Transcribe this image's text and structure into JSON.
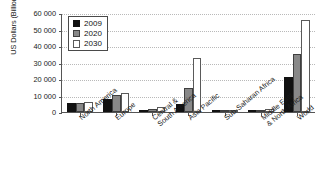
{
  "chart_data": {
    "type": "bar",
    "title": "",
    "subtitle": "",
    "xlabel": "",
    "ylabel": "US Dollars (Billions)",
    "ylim": [
      0,
      60000
    ],
    "yticks": [
      "0",
      "10 000",
      "20 000",
      "30 000",
      "40 000",
      "50 000",
      "60 000"
    ],
    "ytick_values": [
      0,
      10000,
      20000,
      30000,
      40000,
      50000,
      60000
    ],
    "grid": true,
    "grid_axis": "y",
    "legend_position": "top-left",
    "categories": [
      "North America",
      "Europe",
      "Central & South America",
      "Asia Pacific",
      "Sub-Saharan Africa",
      "Middle East & North Africa",
      "World"
    ],
    "category_lines": [
      [
        "North America"
      ],
      [
        "Europe"
      ],
      [
        "Central &",
        "South America"
      ],
      [
        "Asia Pacific"
      ],
      [
        "Sub-Saharan Africa"
      ],
      [
        "Middle East",
        "& North Africa"
      ],
      [
        "World"
      ]
    ],
    "series": [
      {
        "name": "2009",
        "color": "#111111",
        "values": [
          5500,
          7900,
          1400,
          4700,
          400,
          700,
          21000
        ]
      },
      {
        "name": "2020",
        "color": "#888888",
        "values": [
          5500,
          10200,
          2100,
          14700,
          500,
          1200,
          35200
        ]
      },
      {
        "name": "2030",
        "color": "#ffffff",
        "values": [
          5800,
          11300,
          3000,
          32500,
          700,
          1900,
          55800
        ]
      }
    ]
  },
  "legend": {
    "items": [
      {
        "label": "2009",
        "key": "s2009"
      },
      {
        "label": "2020",
        "key": "s2020"
      },
      {
        "label": "2030",
        "key": "s2030"
      }
    ]
  },
  "colors": {
    "series_2009": "#111111",
    "series_2020": "#888888",
    "series_2030": "#ffffff",
    "axis": "#555555",
    "grid": "#b9b9b9",
    "background": "#ffffff",
    "text": "#1a1a1a"
  }
}
